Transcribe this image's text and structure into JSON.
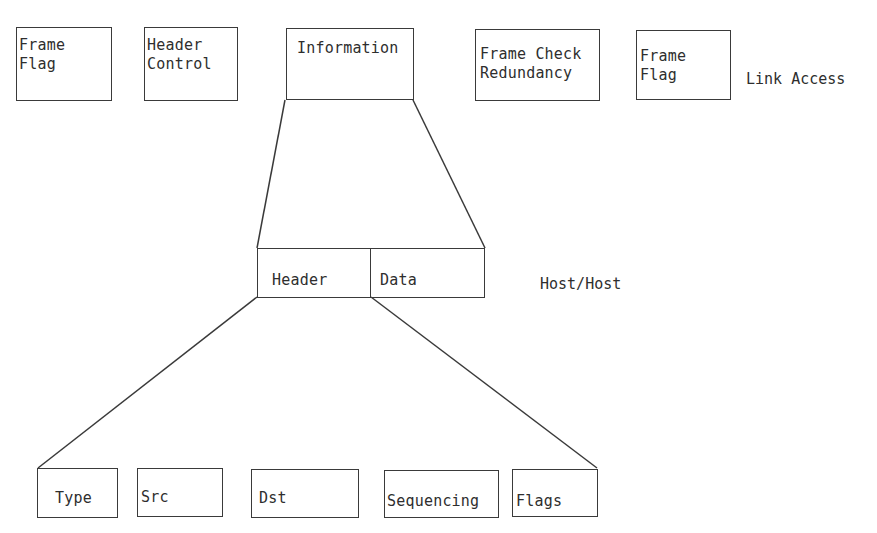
{
  "diagram": {
    "type": "protocol-frame-decomposition",
    "line_color": "#3a3a3a",
    "text_color": "#2e2e2e",
    "levels": {
      "link_access": {
        "label": "Link Access",
        "fields": [
          {
            "line1": "Frame",
            "line2": "Flag"
          },
          {
            "line1": "Header",
            "line2": "Control"
          },
          {
            "line1": "Information",
            "line2": ""
          },
          {
            "line1": "Frame Check",
            "line2": "Redundancy"
          },
          {
            "line1": "Frame",
            "line2": "Flag"
          }
        ]
      },
      "host_host": {
        "label": "Host/Host",
        "fields": [
          {
            "line1": "Header"
          },
          {
            "line1": "Data"
          }
        ]
      },
      "header_detail": {
        "fields": [
          {
            "line1": "Type"
          },
          {
            "line1": "Src"
          },
          {
            "line1": "Dst"
          },
          {
            "line1": "Sequencing"
          },
          {
            "line1": "Flags"
          }
        ]
      }
    },
    "expansions": [
      {
        "from": "Information",
        "to": "Host/Host (Header + Data)"
      },
      {
        "from": "Header",
        "to": "Type, Src, Dst, Sequencing, Flags"
      }
    ]
  }
}
